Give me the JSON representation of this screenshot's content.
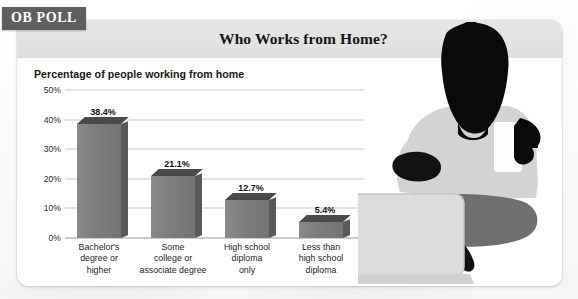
{
  "badge": {
    "label": "OB POLL"
  },
  "header": {
    "title": "Who Works from Home?"
  },
  "chart_data": {
    "type": "bar",
    "title": "Who Works from Home?",
    "subtitle": "Percentage of people working from home",
    "xlabel": "",
    "ylabel": "",
    "ylim": [
      0,
      50
    ],
    "yticks": [
      "0%",
      "10%",
      "20%",
      "30%",
      "40%",
      "50%"
    ],
    "ytick_values": [
      0,
      10,
      20,
      30,
      40,
      50
    ],
    "grid": true,
    "legend": "none",
    "categories": [
      "Bachelor's\ndegree or\nhigher",
      "Some\ncollege or\nassociate degree",
      "High school\ndiploma\nonly",
      "Less than\nhigh school\ndiploma"
    ],
    "values": [
      38.4,
      21.1,
      12.7,
      5.4
    ],
    "data_labels": [
      "38.4%",
      "21.1%",
      "12.7%",
      "5.4%"
    ],
    "bar_color": "#7d7d7d",
    "bar_top_color": "#4a4a4a",
    "bar_side_color": "#5a5a5a",
    "gridline_color": "#c9c9c9"
  },
  "illustration": {
    "name": "person-with-laptop-and-mug-silhouette",
    "person_color": "#0a0a0a",
    "body_color": "#d3d3d3",
    "leg_color": "#6f6f6f",
    "laptop_color": "#d9d9d9"
  },
  "colors": {
    "badge_bg": "#5f5f5f",
    "badge_text": "#ffffff",
    "header_band": "#e3e3e3",
    "card_bg": "#ffffff",
    "page_bg": "#fbfbfa"
  }
}
